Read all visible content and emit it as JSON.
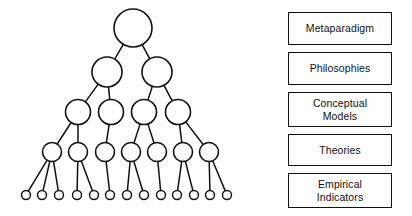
{
  "figure": {
    "background_color": "#ffffff",
    "line_color": "#111111",
    "node_fill": "#ffffff"
  },
  "level_labels": [
    {
      "id": "metaparadigm",
      "text": "Metaparadigm"
    },
    {
      "id": "philosophies",
      "text": "Philosophies"
    },
    {
      "id": "conceptual-models",
      "text": "Conceptual\nModels"
    },
    {
      "id": "theories",
      "text": "Theories"
    },
    {
      "id": "empirical-indicators",
      "text": "Empirical\nIndicators"
    }
  ],
  "tree": {
    "levels": [
      {
        "level": 0,
        "name": "metaparadigm",
        "node_count": 1,
        "radius": 19,
        "y": 28,
        "x_positions": [
          133
        ]
      },
      {
        "level": 1,
        "name": "philosophies",
        "node_count": 2,
        "radius": 15,
        "y": 72,
        "x_positions": [
          107,
          157
        ]
      },
      {
        "level": 2,
        "name": "conceptual-models",
        "node_count": 4,
        "radius": 12.5,
        "y": 112,
        "x_positions": [
          78,
          111,
          144,
          178
        ]
      },
      {
        "level": 3,
        "name": "theories",
        "node_count": 7,
        "radius": 9.5,
        "y": 152,
        "x_positions": [
          52,
          78,
          105,
          131,
          157,
          183,
          209
        ]
      },
      {
        "level": 4,
        "name": "empirical-indicators",
        "node_count": 13,
        "radius": 4.5,
        "y": 195,
        "x_positions": [
          26,
          42,
          59,
          77,
          94,
          110,
          127,
          144,
          161,
          177,
          194,
          210,
          227
        ]
      }
    ],
    "edges": [
      {
        "from_level": 0,
        "from_index": 0,
        "to_level": 1,
        "to_index": 0
      },
      {
        "from_level": 0,
        "from_index": 0,
        "to_level": 1,
        "to_index": 1
      },
      {
        "from_level": 1,
        "from_index": 0,
        "to_level": 2,
        "to_index": 0
      },
      {
        "from_level": 1,
        "from_index": 0,
        "to_level": 2,
        "to_index": 1
      },
      {
        "from_level": 1,
        "from_index": 1,
        "to_level": 2,
        "to_index": 2
      },
      {
        "from_level": 1,
        "from_index": 1,
        "to_level": 2,
        "to_index": 3
      },
      {
        "from_level": 2,
        "from_index": 0,
        "to_level": 3,
        "to_index": 0
      },
      {
        "from_level": 2,
        "from_index": 0,
        "to_level": 3,
        "to_index": 1
      },
      {
        "from_level": 2,
        "from_index": 1,
        "to_level": 3,
        "to_index": 2
      },
      {
        "from_level": 2,
        "from_index": 2,
        "to_level": 3,
        "to_index": 3
      },
      {
        "from_level": 2,
        "from_index": 2,
        "to_level": 3,
        "to_index": 4
      },
      {
        "from_level": 2,
        "from_index": 3,
        "to_level": 3,
        "to_index": 5
      },
      {
        "from_level": 2,
        "from_index": 3,
        "to_level": 3,
        "to_index": 6
      },
      {
        "from_level": 3,
        "from_index": 0,
        "to_level": 4,
        "to_index": 0
      },
      {
        "from_level": 3,
        "from_index": 0,
        "to_level": 4,
        "to_index": 1
      },
      {
        "from_level": 3,
        "from_index": 0,
        "to_level": 4,
        "to_index": 2
      },
      {
        "from_level": 3,
        "from_index": 1,
        "to_level": 4,
        "to_index": 3
      },
      {
        "from_level": 3,
        "from_index": 1,
        "to_level": 4,
        "to_index": 4
      },
      {
        "from_level": 3,
        "from_index": 2,
        "to_level": 4,
        "to_index": 5
      },
      {
        "from_level": 3,
        "from_index": 3,
        "to_level": 4,
        "to_index": 6
      },
      {
        "from_level": 3,
        "from_index": 3,
        "to_level": 4,
        "to_index": 7
      },
      {
        "from_level": 3,
        "from_index": 4,
        "to_level": 4,
        "to_index": 8
      },
      {
        "from_level": 3,
        "from_index": 5,
        "to_level": 4,
        "to_index": 9
      },
      {
        "from_level": 3,
        "from_index": 5,
        "to_level": 4,
        "to_index": 10
      },
      {
        "from_level": 3,
        "from_index": 6,
        "to_level": 4,
        "to_index": 11
      },
      {
        "from_level": 3,
        "from_index": 6,
        "to_level": 4,
        "to_index": 12
      }
    ]
  }
}
